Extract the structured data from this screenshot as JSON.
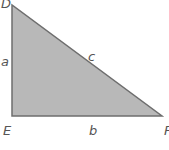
{
  "diagram": {
    "type": "right-triangle",
    "fill_color": "#b8b8b8",
    "edge_color": "#6e6e6e",
    "vertices": {
      "D": {
        "label": "D",
        "x": 12,
        "y": 5
      },
      "E": {
        "label": "E",
        "x": 12,
        "y": 116
      },
      "F": {
        "label": "F",
        "x": 162,
        "y": 116
      }
    },
    "sides": {
      "a": {
        "label": "a",
        "between": "D-E"
      },
      "b": {
        "label": "b",
        "between": "E-F"
      },
      "c": {
        "label": "c",
        "between": "D-F"
      }
    }
  }
}
